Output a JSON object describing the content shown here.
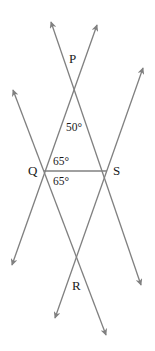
{
  "diagram": {
    "type": "geometry",
    "line_color": "#808080",
    "text_color": "#1a1a1a",
    "points": {
      "P": {
        "label": "P",
        "x": 75,
        "y": 87,
        "label_x": 69,
        "label_y": 63
      },
      "Q": {
        "label": "Q",
        "x": 44,
        "y": 171,
        "label_x": 28,
        "label_y": 175
      },
      "S": {
        "label": "S",
        "x": 107,
        "y": 171,
        "label_x": 113,
        "label_y": 175
      },
      "R": {
        "label": "R",
        "x": 77,
        "y": 256,
        "label_x": 72,
        "label_y": 290
      }
    },
    "lines": [
      {
        "id": "line-through-P-S",
        "x1": 51,
        "y1": 22,
        "x2": 141,
        "y2": 285
      },
      {
        "id": "line-through-P-Q",
        "x1": 97,
        "y1": 25,
        "x2": 12,
        "y2": 265
      },
      {
        "id": "line-through-Q-R",
        "x1": 13,
        "y1": 90,
        "x2": 106,
        "y2": 335
      },
      {
        "id": "line-through-S-R",
        "x1": 143,
        "y1": 68,
        "x2": 55,
        "y2": 318
      }
    ],
    "segment_QS": {
      "x1": 44,
      "y1": 171,
      "x2": 107,
      "y2": 171
    },
    "angles": [
      {
        "id": "angle-P",
        "label": "50°",
        "x": 66,
        "y": 131
      },
      {
        "id": "angle-PQS",
        "label": "65°",
        "x": 53,
        "y": 165
      },
      {
        "id": "angle-SQR",
        "label": "65°",
        "x": 53,
        "y": 185
      }
    ]
  }
}
